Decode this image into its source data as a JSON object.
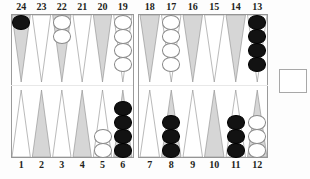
{
  "board": {
    "title": "Backgammon position diagram",
    "top_point_labels": [
      "24",
      "23",
      "22",
      "21",
      "20",
      "19",
      "18",
      "17",
      "16",
      "15",
      "14",
      "13"
    ],
    "bottom_point_labels": [
      "1",
      "2",
      "3",
      "4",
      "5",
      "6",
      "7",
      "8",
      "9",
      "10",
      "11",
      "12"
    ],
    "colors": {
      "black_checker": "#121212",
      "white_checker": "#ffffff",
      "dark_point": "#d6d6d6",
      "light_point": "#ffffff",
      "frame": "#9a9a9a",
      "label_text": "#231f20"
    },
    "points": [
      {
        "number": "24",
        "row": "top",
        "index": 0,
        "color": "black",
        "count": 1
      },
      {
        "number": "23",
        "row": "top",
        "index": 1,
        "color": "none",
        "count": 0
      },
      {
        "number": "22",
        "row": "top",
        "index": 2,
        "color": "white",
        "count": 2
      },
      {
        "number": "21",
        "row": "top",
        "index": 3,
        "color": "none",
        "count": 0
      },
      {
        "number": "20",
        "row": "top",
        "index": 4,
        "color": "none",
        "count": 0
      },
      {
        "number": "19",
        "row": "top",
        "index": 5,
        "color": "white",
        "count": 4
      },
      {
        "number": "18",
        "row": "top",
        "index": 6,
        "color": "none",
        "count": 0
      },
      {
        "number": "17",
        "row": "top",
        "index": 7,
        "color": "white",
        "count": 4
      },
      {
        "number": "16",
        "row": "top",
        "index": 8,
        "color": "none",
        "count": 0
      },
      {
        "number": "15",
        "row": "top",
        "index": 9,
        "color": "none",
        "count": 0
      },
      {
        "number": "14",
        "row": "top",
        "index": 10,
        "color": "none",
        "count": 0
      },
      {
        "number": "13",
        "row": "top",
        "index": 11,
        "color": "black",
        "count": 4
      },
      {
        "number": "1",
        "row": "bottom",
        "index": 0,
        "color": "none",
        "count": 0
      },
      {
        "number": "2",
        "row": "bottom",
        "index": 1,
        "color": "none",
        "count": 0
      },
      {
        "number": "3",
        "row": "bottom",
        "index": 2,
        "color": "none",
        "count": 0
      },
      {
        "number": "4",
        "row": "bottom",
        "index": 3,
        "color": "none",
        "count": 0
      },
      {
        "number": "5",
        "row": "bottom",
        "index": 4,
        "color": "white",
        "count": 2
      },
      {
        "number": "6",
        "row": "bottom",
        "index": 5,
        "color": "black",
        "count": 4
      },
      {
        "number": "7",
        "row": "bottom",
        "index": 6,
        "color": "none",
        "count": 0
      },
      {
        "number": "8",
        "row": "bottom",
        "index": 7,
        "color": "black",
        "count": 3
      },
      {
        "number": "9",
        "row": "bottom",
        "index": 8,
        "color": "none",
        "count": 0
      },
      {
        "number": "10",
        "row": "bottom",
        "index": 9,
        "color": "none",
        "count": 0
      },
      {
        "number": "11",
        "row": "bottom",
        "index": 10,
        "color": "black",
        "count": 3
      },
      {
        "number": "12",
        "row": "bottom",
        "index": 11,
        "color": "white",
        "count": 3
      }
    ],
    "cube_tray": {
      "label": "",
      "value": ""
    },
    "caption": ""
  }
}
